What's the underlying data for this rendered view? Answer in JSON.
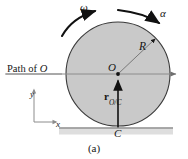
{
  "figure": {
    "caption": "(a)",
    "colors": {
      "disk_fill": "#c9c9c9",
      "disk_stroke": "#3a3a3a",
      "line": "#8c8c8c",
      "arrow_dark": "#111111",
      "ground_band": "#dedede",
      "text": "#161616"
    },
    "labels": {
      "path_of_o_prefix": "Path of ",
      "path_of_o_point": "O",
      "omega": "ω",
      "alpha": "α",
      "radius": "R",
      "center": "O",
      "contact_point": "C",
      "axis_y": "y",
      "axis_x": "x",
      "vector_symbol": "r",
      "vector_subscript": "O/C"
    },
    "geometry": {
      "disk_center_x": 118,
      "disk_center_y": 74,
      "disk_radius": 52,
      "path_line_y": 74,
      "ground_line_y": 128
    }
  }
}
